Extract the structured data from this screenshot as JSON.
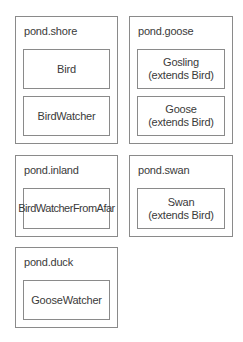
{
  "packages": [
    {
      "name": "pond.shore",
      "classes": [
        {
          "line1": "Bird",
          "line2": ""
        },
        {
          "line1": "BirdWatcher",
          "line2": ""
        }
      ]
    },
    {
      "name": "pond.goose",
      "classes": [
        {
          "line1": "Gosling",
          "line2": "(extends Bird)"
        },
        {
          "line1": "Goose",
          "line2": "(extends Bird)"
        }
      ]
    },
    {
      "name": "pond.inland",
      "classes": [
        {
          "line1": "BirdWatcherFromAfar",
          "line2": ""
        }
      ]
    },
    {
      "name": "pond.swan",
      "classes": [
        {
          "line1": "Swan",
          "line2": "(extends Bird)"
        }
      ]
    },
    {
      "name": "pond.duck",
      "classes": [
        {
          "line1": "GooseWatcher",
          "line2": ""
        }
      ]
    }
  ],
  "colors": {
    "border": "#8a8a8a",
    "text": "#3a3a3a",
    "background": "#ffffff"
  }
}
